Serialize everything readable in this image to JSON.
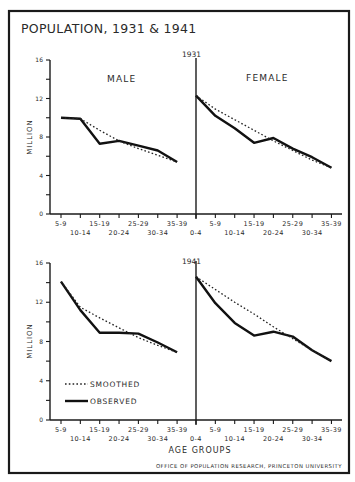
{
  "title": "POPULATION, 1931 & 1941",
  "credit": "OFFICE OF POPULATION RESEARCH, PRINCETON UNIVERSITY",
  "colors": {
    "ink": "#111111",
    "paper": "#ffffff"
  },
  "labels": {
    "male": "MALE",
    "female": "FEMALE",
    "ylabel": "MILLION",
    "xlabel": "AGE GROUPS",
    "year_top": "1931",
    "year_bottom": "1941",
    "legend_smoothed": "SMOOTHED",
    "legend_observed": "OBSERVED"
  },
  "chart_data": [
    {
      "type": "line",
      "title": "1931 Male",
      "xlabel": "AGE GROUPS",
      "ylabel": "MILLION",
      "ylim": [
        0,
        16
      ],
      "yticks": [
        0,
        4,
        8,
        12,
        16
      ],
      "categories": [
        "5-9",
        "10-14",
        "15-19",
        "20-24",
        "25-29",
        "30-34",
        "35-39"
      ],
      "series": [
        {
          "name": "OBSERVED",
          "values": [
            10.0,
            9.9,
            7.3,
            7.6,
            7.1,
            6.6,
            5.4
          ]
        },
        {
          "name": "SMOOTHED",
          "values": [
            10.0,
            9.9,
            8.7,
            7.6,
            6.8,
            6.1,
            5.4
          ]
        }
      ]
    },
    {
      "type": "line",
      "title": "1931 Female",
      "xlabel": "AGE GROUPS",
      "ylabel": "MILLION",
      "ylim": [
        0,
        16
      ],
      "categories": [
        "0-4",
        "5-9",
        "10-14",
        "15-19",
        "20-24",
        "25-29",
        "30-34",
        "35-39"
      ],
      "series": [
        {
          "name": "OBSERVED",
          "values": [
            12.3,
            10.2,
            8.9,
            7.4,
            7.9,
            6.8,
            5.9,
            4.8
          ]
        },
        {
          "name": "SMOOTHED",
          "values": [
            12.3,
            10.9,
            9.8,
            8.7,
            7.6,
            6.6,
            5.6,
            4.8
          ]
        }
      ]
    },
    {
      "type": "line",
      "title": "1941 Male",
      "xlabel": "AGE GROUPS",
      "ylabel": "MILLION",
      "ylim": [
        0,
        16
      ],
      "yticks": [
        0,
        4,
        8,
        12,
        16
      ],
      "categories": [
        "5-9",
        "10-14",
        "15-19",
        "20-24",
        "25-29",
        "30-34",
        "35-39"
      ],
      "series": [
        {
          "name": "OBSERVED",
          "values": [
            14.1,
            11.2,
            8.9,
            8.9,
            8.8,
            7.9,
            6.9
          ]
        },
        {
          "name": "SMOOTHED",
          "values": [
            14.1,
            11.5,
            10.4,
            9.4,
            8.4,
            7.6,
            6.9
          ]
        }
      ]
    },
    {
      "type": "line",
      "title": "1941 Female",
      "xlabel": "AGE GROUPS",
      "ylabel": "MILLION",
      "ylim": [
        0,
        16
      ],
      "categories": [
        "0-4",
        "5-9",
        "10-14",
        "15-19",
        "20-24",
        "25-29",
        "30-34",
        "35-39"
      ],
      "series": [
        {
          "name": "OBSERVED",
          "values": [
            14.6,
            11.9,
            9.9,
            8.6,
            9.0,
            8.5,
            7.1,
            6.0
          ]
        },
        {
          "name": "SMOOTHED",
          "values": [
            14.6,
            13.3,
            12.0,
            10.8,
            9.5,
            8.3,
            7.1,
            6.0
          ]
        }
      ]
    }
  ]
}
